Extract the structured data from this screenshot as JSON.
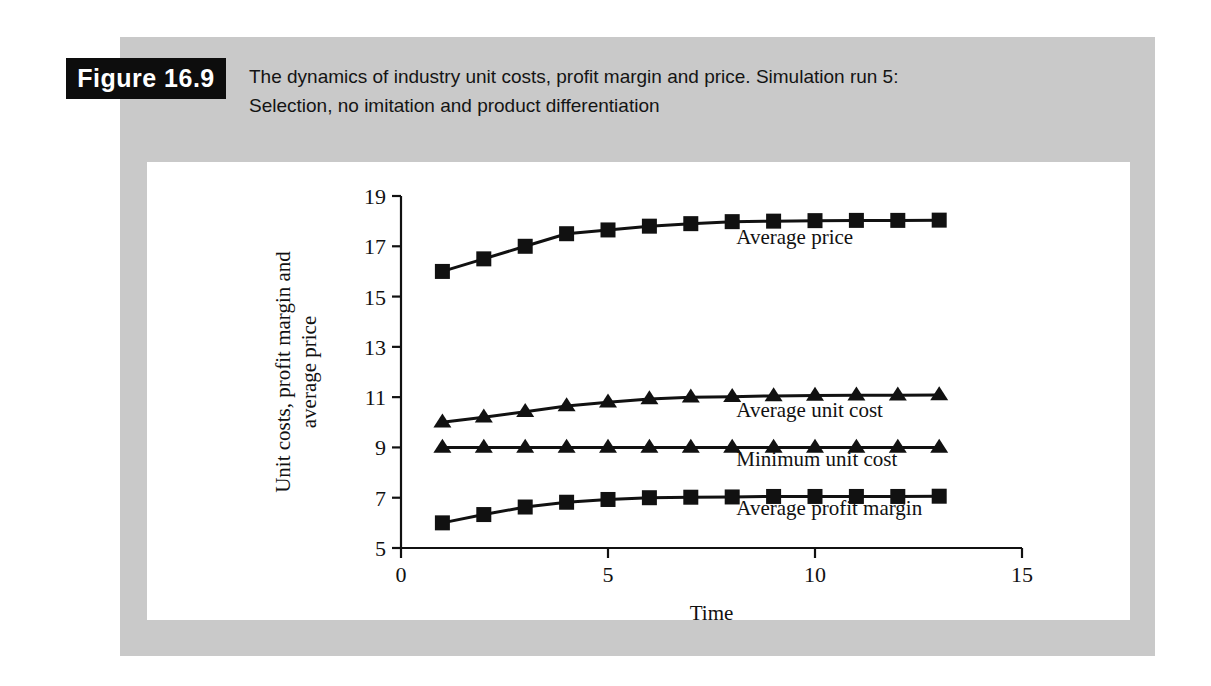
{
  "figure": {
    "badge_label": "Figure 16.9",
    "caption_line1": "The dynamics of industry unit costs, profit margin and price. Simulation run 5:",
    "caption_line2": "Selection, no imitation and product differentiation",
    "panel_color": "#c9c9c9",
    "badge_bg_color": "#0d0d0d",
    "badge_text_color": "#ffffff",
    "plot_bg_color": "#ffffff"
  },
  "chart_data": {
    "type": "line",
    "title": "",
    "xlabel": "Time",
    "ylabel": "Unit costs, profit margin and average price",
    "xlim": [
      0,
      15
    ],
    "ylim": [
      5,
      19
    ],
    "xticks": [
      0,
      5,
      10,
      15
    ],
    "xtick_labels": [
      "0",
      "5",
      "10",
      "15"
    ],
    "yticks": [
      5,
      7,
      9,
      11,
      13,
      15,
      17,
      19
    ],
    "ytick_labels": [
      "5",
      "7",
      "9",
      "11",
      "13",
      "15",
      "17",
      "19"
    ],
    "grid": false,
    "legend_position": "inline-annotations",
    "x": [
      1,
      2,
      3,
      4,
      5,
      6,
      7,
      8,
      9,
      10,
      11,
      12,
      13
    ],
    "series": [
      {
        "name": "Average price",
        "marker": "square",
        "color": "#111111",
        "values": [
          16.0,
          16.5,
          17.0,
          17.5,
          17.65,
          17.8,
          17.9,
          17.98,
          18.0,
          18.02,
          18.03,
          18.03,
          18.04
        ],
        "label_x": 8.1,
        "label_y": 17.1
      },
      {
        "name": "Average unit cost",
        "marker": "triangle",
        "color": "#111111",
        "values": [
          10.0,
          10.2,
          10.42,
          10.65,
          10.8,
          10.93,
          11.0,
          11.02,
          11.05,
          11.07,
          11.08,
          11.08,
          11.09
        ],
        "label_x": 8.1,
        "label_y": 10.23
      },
      {
        "name": "Minimum unit cost",
        "marker": "triangle",
        "color": "#111111",
        "values": [
          9.0,
          9.0,
          9.0,
          9.0,
          9.0,
          9.0,
          9.0,
          9.0,
          9.0,
          9.0,
          9.0,
          9.0,
          9.0
        ],
        "label_x": 8.1,
        "label_y": 8.27
      },
      {
        "name": "Average profit margin",
        "marker": "square",
        "color": "#111111",
        "values": [
          6.0,
          6.33,
          6.63,
          6.82,
          6.93,
          7.0,
          7.02,
          7.03,
          7.05,
          7.05,
          7.05,
          7.05,
          7.06
        ],
        "label_x": 8.1,
        "label_y": 6.33
      }
    ]
  }
}
